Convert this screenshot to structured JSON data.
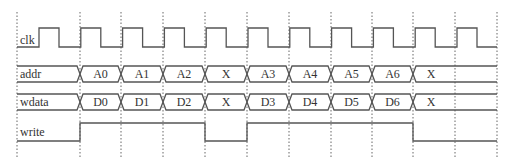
{
  "diagram": {
    "type": "timing-diagram",
    "gridlines_x": [
      17,
      80,
      121,
      163,
      205,
      247,
      289,
      331,
      372,
      413,
      455,
      497
    ],
    "grid_y": [
      12,
      158
    ],
    "signals": [
      {
        "name": "clk",
        "kind": "clock",
        "high_y": 28,
        "low_y": 47,
        "start_x": 17,
        "end_x": 497,
        "first_rise_x": 39,
        "period": 41.8,
        "high_width": 20
      },
      {
        "name": "addr",
        "kind": "bus",
        "top_y": 66,
        "bottom_y": 82,
        "segments": [
          {
            "from": 17,
            "to": 80,
            "value": ""
          },
          {
            "from": 80,
            "to": 121,
            "value": "A0"
          },
          {
            "from": 121,
            "to": 163,
            "value": "A1"
          },
          {
            "from": 163,
            "to": 205,
            "value": "A2"
          },
          {
            "from": 205,
            "to": 247,
            "value": "X"
          },
          {
            "from": 247,
            "to": 289,
            "value": "A3"
          },
          {
            "from": 289,
            "to": 331,
            "value": "A4"
          },
          {
            "from": 331,
            "to": 372,
            "value": "A5"
          },
          {
            "from": 372,
            "to": 413,
            "value": "A6"
          },
          {
            "from": 413,
            "to": 497,
            "value": "X"
          }
        ]
      },
      {
        "name": "wdata",
        "kind": "bus",
        "top_y": 94,
        "bottom_y": 110,
        "segments": [
          {
            "from": 17,
            "to": 80,
            "value": ""
          },
          {
            "from": 80,
            "to": 121,
            "value": "D0"
          },
          {
            "from": 121,
            "to": 163,
            "value": "D1"
          },
          {
            "from": 163,
            "to": 205,
            "value": "D2"
          },
          {
            "from": 205,
            "to": 247,
            "value": "X"
          },
          {
            "from": 247,
            "to": 289,
            "value": "D3"
          },
          {
            "from": 289,
            "to": 331,
            "value": "D4"
          },
          {
            "from": 331,
            "to": 372,
            "value": "D5"
          },
          {
            "from": 372,
            "to": 413,
            "value": "D6"
          },
          {
            "from": 413,
            "to": 497,
            "value": "X"
          }
        ]
      },
      {
        "name": "write",
        "kind": "digital",
        "high_y": 123,
        "low_y": 141,
        "points": [
          [
            17,
            0
          ],
          [
            80,
            1
          ],
          [
            205,
            0
          ],
          [
            247,
            1
          ],
          [
            413,
            0
          ],
          [
            497,
            0
          ]
        ]
      }
    ],
    "colors": {
      "line": "#555555",
      "grid": "#666666",
      "text": "#333333",
      "background": "#ffffff"
    }
  }
}
